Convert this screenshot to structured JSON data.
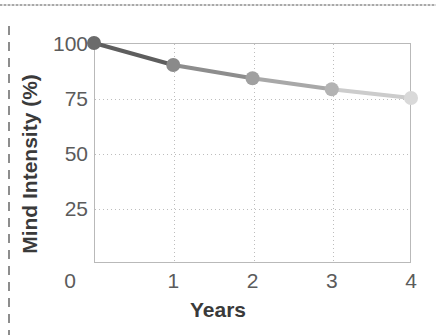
{
  "chart_data": {
    "type": "line",
    "title": "",
    "xlabel": "Years",
    "ylabel": "Mind Intensity (%)",
    "x": [
      0,
      1,
      2,
      3,
      4
    ],
    "values": [
      100,
      90,
      84,
      79,
      75
    ],
    "xtick_labels": [
      "0",
      "1",
      "2",
      "3",
      "4"
    ],
    "ytick_labels": [
      "100",
      "75",
      "50",
      "25"
    ],
    "ytick_values": [
      100,
      75,
      50,
      25
    ],
    "xlim": [
      0,
      4
    ],
    "ylim": [
      0,
      100
    ],
    "grid": true,
    "legend": "none",
    "series": [
      {
        "name": "Mind Intensity",
        "values": [
          100,
          90,
          84,
          79,
          75
        ],
        "point_colors": [
          "#6b6b6b",
          "#8a8a8a",
          "#a0a0a0",
          "#b3b3b3",
          "#d9d9d9"
        ],
        "line_colors": [
          "#5e5e5e",
          "#8d8d8d",
          "#a8a8a8",
          "#cccccc"
        ]
      }
    ]
  },
  "axes": {
    "x_title": "Years",
    "y_title": "Mind Intensity (%)"
  },
  "colors": {
    "frame": "#b9b9b9",
    "grid": "#bdbdbd",
    "tick_text": "#5b5b5b",
    "title_text": "#3a3a3a",
    "scan_rule": "#9a9a9a"
  }
}
